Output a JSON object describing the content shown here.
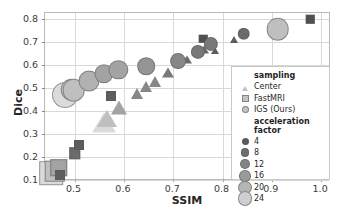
{
  "chart_data": {
    "type": "scatter",
    "title": "",
    "xlabel": "SSIM",
    "ylabel": "Dice",
    "xlim": [
      0.44,
      1.02
    ],
    "ylim": [
      0.095,
      0.825
    ],
    "xticks": [
      "0.5",
      "0.6",
      "0.7",
      "0.8",
      "0.9",
      "1.0"
    ],
    "xtick_values": [
      0.5,
      0.6,
      0.7,
      0.8,
      0.9,
      1.0
    ],
    "yticks": [
      "0.1",
      "0.2",
      "0.3",
      "0.4",
      "0.5",
      "0.6",
      "0.7",
      "0.8"
    ],
    "ytick_values": [
      0.1,
      0.2,
      0.3,
      0.4,
      0.5,
      0.6,
      0.7,
      0.8
    ],
    "grid": true,
    "legend_position": "lower right",
    "size_encodes": "acceleration factor",
    "color_encodes": "acceleration factor",
    "shape_encodes": "sampling",
    "series": [
      {
        "name": "Center",
        "marker": "triangle",
        "points": [
          {
            "x": 0.56,
            "y": 0.357,
            "accel": 24
          },
          {
            "x": 0.566,
            "y": 0.371,
            "accel": 20
          },
          {
            "x": 0.59,
            "y": 0.42,
            "accel": 16
          },
          {
            "x": 0.626,
            "y": 0.481,
            "accel": 12
          },
          {
            "x": 0.645,
            "y": 0.512,
            "accel": 12
          },
          {
            "x": 0.663,
            "y": 0.535,
            "accel": 12
          },
          {
            "x": 0.69,
            "y": 0.575,
            "accel": 10
          },
          {
            "x": 0.728,
            "y": 0.628,
            "accel": 8
          },
          {
            "x": 0.762,
            "y": 0.672,
            "accel": 8
          },
          {
            "x": 0.784,
            "y": 0.668,
            "accel": 6
          },
          {
            "x": 0.823,
            "y": 0.718,
            "accel": 6
          },
          {
            "x": 0.898,
            "y": 0.765,
            "accel": 4
          }
        ]
      },
      {
        "name": "FastMRI",
        "marker": "square",
        "points": [
          {
            "x": 0.452,
            "y": 0.128,
            "accel": 24
          },
          {
            "x": 0.46,
            "y": 0.137,
            "accel": 20
          },
          {
            "x": 0.468,
            "y": 0.152,
            "accel": 16
          },
          {
            "x": 0.471,
            "y": 0.122,
            "accel": 6
          },
          {
            "x": 0.5,
            "y": 0.216,
            "accel": 8
          },
          {
            "x": 0.508,
            "y": 0.25,
            "accel": 6
          },
          {
            "x": 0.573,
            "y": 0.463,
            "accel": 6
          },
          {
            "x": 0.761,
            "y": 0.712,
            "accel": 4
          },
          {
            "x": 0.978,
            "y": 0.797,
            "accel": 4
          }
        ]
      },
      {
        "name": "IGS (Ours)",
        "marker": "circle",
        "points": [
          {
            "x": 0.48,
            "y": 0.468,
            "accel": 24
          },
          {
            "x": 0.494,
            "y": 0.492,
            "accel": 20
          },
          {
            "x": 0.498,
            "y": 0.49,
            "accel": 20
          },
          {
            "x": 0.53,
            "y": 0.529,
            "accel": 18
          },
          {
            "x": 0.559,
            "y": 0.562,
            "accel": 16
          },
          {
            "x": 0.589,
            "y": 0.579,
            "accel": 16
          },
          {
            "x": 0.645,
            "y": 0.594,
            "accel": 14
          },
          {
            "x": 0.71,
            "y": 0.617,
            "accel": 12
          },
          {
            "x": 0.75,
            "y": 0.655,
            "accel": 10
          },
          {
            "x": 0.777,
            "y": 0.692,
            "accel": 10
          },
          {
            "x": 0.843,
            "y": 0.735,
            "accel": 8
          },
          {
            "x": 0.905,
            "y": 0.769,
            "accel": 5
          },
          {
            "x": 0.912,
            "y": 0.755,
            "accel": 20
          }
        ]
      }
    ]
  },
  "legend": {
    "sampling_title": "sampling",
    "sampling_items": [
      {
        "label": "Center",
        "marker": "triangle"
      },
      {
        "label": "FastMRI",
        "marker": "square"
      },
      {
        "label": "IGS (Ours)",
        "marker": "circle"
      }
    ],
    "accel_title": "acceleration factor",
    "accel_items": [
      {
        "label": "4",
        "size": 5.0,
        "color": "#5a5a5a"
      },
      {
        "label": "8",
        "size": 6.6,
        "color": "#6e6e6e"
      },
      {
        "label": "12",
        "size": 8.2,
        "color": "#848484"
      },
      {
        "label": "16",
        "size": 9.6,
        "color": "#9b9b9b"
      },
      {
        "label": "20",
        "size": 11.2,
        "color": "#b5b5b5"
      },
      {
        "label": "24",
        "size": 12.6,
        "color": "#cfcfcf"
      }
    ]
  },
  "colors": {
    "axis": "#b9b9b9",
    "grid": "#d8d8d8",
    "text": "#262626",
    "marker_dark": "#4f4f4f",
    "marker_light": "#d4d4d4",
    "background": "#ffffff"
  }
}
